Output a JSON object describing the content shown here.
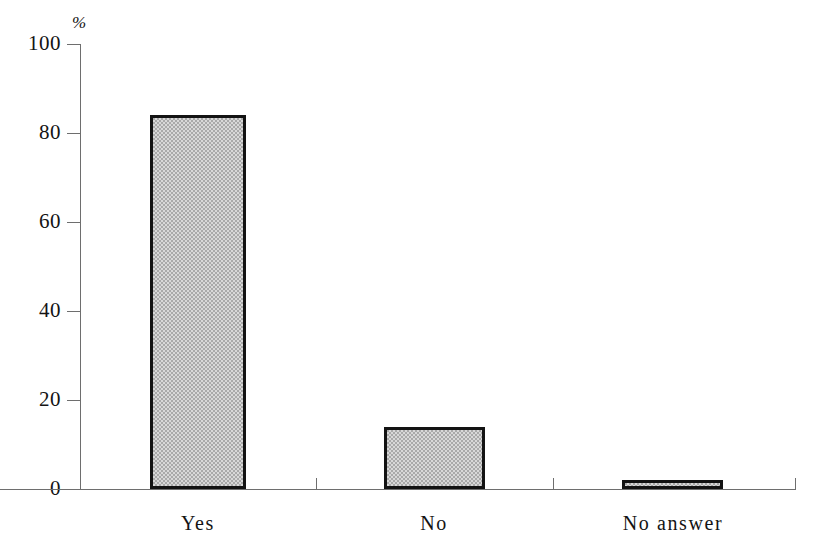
{
  "chart_data": {
    "type": "bar",
    "title": "",
    "subtitle": "",
    "xlabel": "",
    "ylabel": "%",
    "categories": [
      "Yes",
      "No",
      "No answer"
    ],
    "values": [
      84,
      14,
      2
    ],
    "series": [
      {
        "name": "Share of responses",
        "values": [
          84,
          14,
          2
        ]
      }
    ],
    "ylim": [
      0,
      100
    ],
    "ytick_labels": [
      "0",
      "20",
      "40",
      "60",
      "80",
      "100"
    ],
    "ytick_values": [
      0,
      20,
      40,
      60,
      80,
      100
    ],
    "grid": false,
    "legend": false,
    "legend_position": "none",
    "annotations": [],
    "colors": {
      "bar_fill": "#a9a9a9",
      "bar_border": "#131313",
      "axis": "#6e6e6e",
      "text": "#141414",
      "background": "#ffffff"
    }
  },
  "axis": {
    "y_unit_label": "%"
  }
}
